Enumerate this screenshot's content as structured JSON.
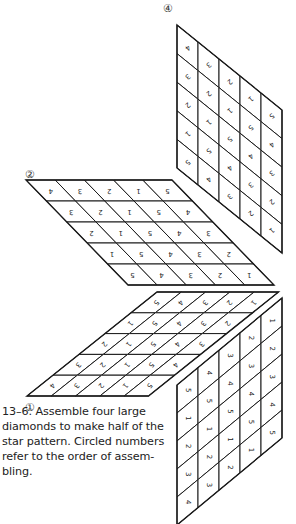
{
  "figure": {
    "caption": "13–6. Assemble four large diamonds to make half of the star pattern. Circled numbers refer to the order of assembling.",
    "caption_lines": [
      "13–6. Assemble four large",
      "diamonds to make half of the",
      "star pattern. Circled numbers",
      "refer to the order of assem-",
      "bling."
    ],
    "line_color": "#1a1a1a",
    "diamonds": [
      {
        "id": "1",
        "circled_label": "①",
        "label_pos": [
          30,
          407
        ],
        "orientation": "horizontal-rows",
        "origin": [
          157,
          292
        ],
        "u": [
          24.3,
          0
        ],
        "v": [
          -26,
          20.8
        ],
        "rows": [
          [
            "5",
            "4",
            "3",
            "2",
            "1"
          ],
          [
            "1",
            "5",
            "4",
            "3",
            "2"
          ],
          [
            "2",
            "1",
            "5",
            "4",
            "3"
          ],
          [
            "3",
            "2",
            "1",
            "5",
            "4"
          ],
          [
            "4",
            "3",
            "2",
            "1",
            "5"
          ]
        ],
        "text_rotation": 130
      },
      {
        "id": "2",
        "circled_label": "②",
        "label_pos": [
          30,
          174
        ],
        "orientation": "horizontal-rows",
        "origin": [
          26,
          180
        ],
        "u": [
          29.2,
          0
        ],
        "v": [
          20.4,
          21
        ],
        "rows": [
          [
            "4",
            "3",
            "2",
            "1",
            "5"
          ],
          [
            "3",
            "2",
            "1",
            "5",
            "4"
          ],
          [
            "2",
            "1",
            "5",
            "4",
            "3"
          ],
          [
            "1",
            "5",
            "4",
            "3",
            "2"
          ],
          [
            "5",
            "4",
            "3",
            "2",
            "1"
          ]
        ],
        "text_rotation": 180
      },
      {
        "id": "3",
        "circled_label": "",
        "label_pos": [
          0,
          0
        ],
        "orientation": "vertical-columns",
        "origin": [
          177,
          385
        ],
        "u": [
          21,
          -17.4
        ],
        "v": [
          0,
          28
        ],
        "columns": [
          [
            "5",
            "1",
            "2",
            "3",
            "4"
          ],
          [
            "4",
            "5",
            "1",
            "2",
            "3"
          ],
          [
            "3",
            "4",
            "5",
            "1",
            "2"
          ],
          [
            "2",
            "3",
            "4",
            "5",
            "1"
          ],
          [
            "1",
            "2",
            "3",
            "4",
            "5"
          ]
        ],
        "text_rotation": 90
      },
      {
        "id": "4",
        "circled_label": "④",
        "label_pos": [
          168,
          8
        ],
        "orientation": "vertical-columns",
        "origin": [
          177,
          25
        ],
        "u": [
          21,
          17
        ],
        "v": [
          0,
          28.6
        ],
        "columns": [
          [
            "4",
            "3",
            "2",
            "1",
            "5"
          ],
          [
            "3",
            "2",
            "1",
            "5",
            "4"
          ],
          [
            "2",
            "1",
            "5",
            "4",
            "3"
          ],
          [
            "1",
            "5",
            "4",
            "3",
            "2"
          ],
          [
            "5",
            "4",
            "3",
            "2",
            "1"
          ]
        ],
        "text_rotation": 140
      }
    ]
  }
}
